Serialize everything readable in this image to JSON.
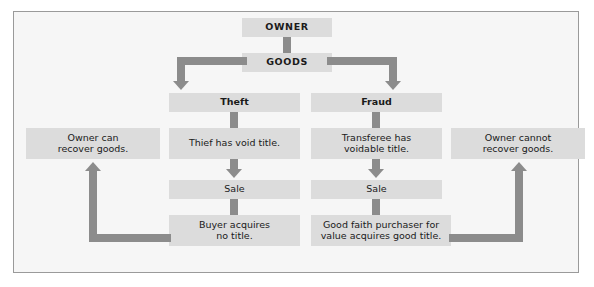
{
  "diagram": {
    "title_text": "",
    "colors": {
      "box_fill": "#dcdcdc",
      "arrow": "#8c8c8c",
      "canvas": "#f6f6f6",
      "frame_border": "#9a9a9a",
      "text": "#1a1a1a"
    },
    "nodes": {
      "owner": "OWNER",
      "goods": "GOODS",
      "theft": "Theft",
      "fraud": "Fraud",
      "thief_title_line1": "Thief has void title.",
      "transferee_title_line1": "Transferee has",
      "transferee_title_line2": "voidable title.",
      "sale_left": "Sale",
      "sale_right": "Sale",
      "buyer_line1": "Buyer acquires",
      "buyer_line2": "no title.",
      "gfp_line1": "Good faith purchaser for",
      "gfp_line2": "value acquires good title.",
      "owner_can_line1": "Owner can",
      "owner_can_line2": "recover goods.",
      "owner_cannot_line1": "Owner cannot",
      "owner_cannot_line2": "recover goods."
    },
    "edges": [
      {
        "from": "owner",
        "to": "goods",
        "style": "straight-down"
      },
      {
        "from": "goods",
        "to": "theft",
        "style": "elbow-left-down-arrow"
      },
      {
        "from": "goods",
        "to": "fraud",
        "style": "elbow-right-down-arrow"
      },
      {
        "from": "theft",
        "to": "thief_title",
        "style": "straight-down"
      },
      {
        "from": "fraud",
        "to": "transferee_title",
        "style": "straight-down"
      },
      {
        "from": "thief_title",
        "to": "sale_left",
        "style": "straight-down-arrow"
      },
      {
        "from": "transferee_title",
        "to": "sale_right",
        "style": "straight-down-arrow"
      },
      {
        "from": "sale_left",
        "to": "buyer",
        "style": "straight-down"
      },
      {
        "from": "sale_right",
        "to": "gfp",
        "style": "straight-down"
      },
      {
        "from": "buyer",
        "to": "owner_can",
        "style": "elbow-left-up-arrow"
      },
      {
        "from": "gfp",
        "to": "owner_cannot",
        "style": "elbow-right-up-arrow"
      }
    ]
  }
}
